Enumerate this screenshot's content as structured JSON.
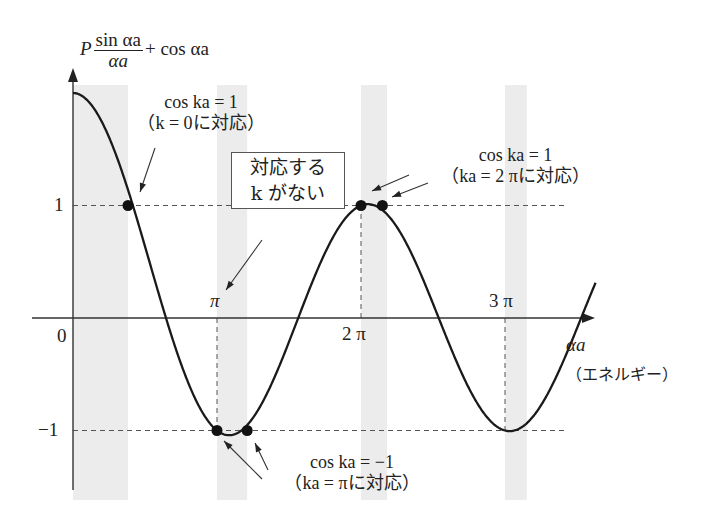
{
  "figure": {
    "y_axis_label": {
      "prefix": "P",
      "numerator": "sin αa",
      "denominator": "αa",
      "suffix": "+ cos αa"
    },
    "x_axis_label": "αa",
    "x_axis_sublabel": "（エネルギー）",
    "origin_label": "0",
    "y_ticks": [
      {
        "value": 1,
        "label": "1"
      },
      {
        "value": -1,
        "label": "−1"
      }
    ],
    "x_ticks": [
      {
        "value_pi": 1,
        "label": "π"
      },
      {
        "value_pi": 2,
        "label": "2 π"
      },
      {
        "value_pi": 3,
        "label": "3 π"
      }
    ],
    "annotations": {
      "k0": {
        "line1": "cos ka = 1",
        "line2": "（k = 0に対応）"
      },
      "no_k": {
        "line1": "対応する",
        "line2": "k がない"
      },
      "k2pi": {
        "line1": "cos ka = 1",
        "line2": "（ka = 2 πに対応）"
      },
      "kpi": {
        "line1": "cos ka = −1",
        "line2": "（ka = πに対応）"
      }
    },
    "colors": {
      "curve": "#1a1a1a",
      "band": "#ececec",
      "axis": "#333333",
      "dashed": "#555555",
      "dot": "#111111"
    }
  },
  "chart_data": {
    "type": "line",
    "title": "",
    "xlabel": "αa (エネルギー)",
    "ylabel": "P sin(αa)/αa + cos(αa)",
    "function": "P*sin(x)/x + cos(x)",
    "P": 1.0,
    "x_range_rad": [
      0,
      11.4
    ],
    "ylim": [
      -1.6,
      2.3
    ],
    "allowed_bands_rad": [
      [
        0,
        1.2
      ],
      [
        3.14159,
        3.8
      ],
      [
        6.28319,
        6.85
      ],
      [
        9.42478,
        9.9
      ]
    ],
    "reference_lines_y": [
      1,
      -1
    ],
    "marked_points": [
      {
        "x_rad": 1.2,
        "y": 1,
        "label": "cos ka = 1 (k = 0)"
      },
      {
        "x_rad": 3.14159,
        "y": -1,
        "label": "cos ka = −1 (ka = π)"
      },
      {
        "x_rad": 3.8,
        "y": -1,
        "label": "cos ka = −1 (ka = π)"
      },
      {
        "x_rad": 6.28319,
        "y": 1,
        "label": "cos ka = 1 (ka = 2π)"
      },
      {
        "x_rad": 6.75,
        "y": 1,
        "label": "cos ka = 1 (ka = 2π)"
      }
    ]
  }
}
